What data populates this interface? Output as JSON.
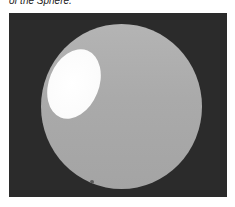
{
  "caption": {
    "text": "of the Sphere."
  },
  "figure": {
    "colors": {
      "background": "#2b2b2b",
      "sphere": "#aaaaaa",
      "highlight": "#ffffff",
      "spot": "#5a5a5a"
    }
  }
}
